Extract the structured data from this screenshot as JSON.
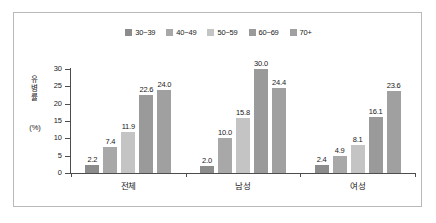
{
  "chart_data": {
    "type": "bar",
    "title": "",
    "xlabel": "",
    "ylabel": "유병률\n(%)",
    "ylabel_main": "유병률",
    "ylabel_unit": "(%)",
    "ylim": [
      0,
      30
    ],
    "yticks": [
      "0",
      "5",
      "10",
      "15",
      "20",
      "25",
      "30"
    ],
    "grid": false,
    "legend_position": "top-center",
    "categories": [
      "전체",
      "남성",
      "여성"
    ],
    "series": [
      {
        "name": "30~39",
        "color": "#8c8c8c",
        "values": [
          2.2,
          2.0,
          2.4
        ]
      },
      {
        "name": "40~49",
        "color": "#a8a8a8",
        "values": [
          7.4,
          10.0,
          4.9
        ]
      },
      {
        "name": "50~59",
        "color": "#c4c4c4",
        "values": [
          11.9,
          15.8,
          8.1
        ]
      },
      {
        "name": "60~69",
        "color": "#9a9a9a",
        "values": [
          22.6,
          30.0,
          16.1
        ]
      },
      {
        "name": "70+",
        "color": "#a0a0a0",
        "values": [
          24.0,
          24.4,
          23.6
        ]
      }
    ],
    "data_labels": {
      "전체": [
        "2.2",
        "7.4",
        "11.9",
        "22.6",
        "24.0"
      ],
      "남성": [
        "2.0",
        "10.0",
        "15.8",
        "30.0",
        "24.4"
      ],
      "여성": [
        "2.4",
        "4.9",
        "8.1",
        "16.1",
        "23.6"
      ]
    }
  },
  "legend": {
    "items": [
      {
        "label": "30~39"
      },
      {
        "label": "40~49"
      },
      {
        "label": "50~59"
      },
      {
        "label": "60~69"
      },
      {
        "label": "70+"
      }
    ]
  },
  "axes": {
    "y_title": "유병률",
    "y_unit": "(%)",
    "y_ticks": [
      "30",
      "25",
      "20",
      "15",
      "10",
      "5",
      "0"
    ],
    "x_categories": [
      "전체",
      "남성",
      "여성"
    ]
  }
}
